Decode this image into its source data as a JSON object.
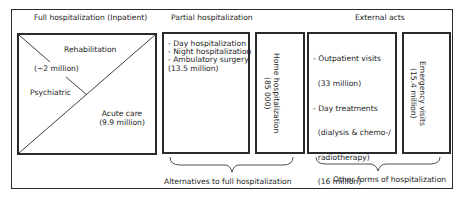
{
  "sections": {
    "full": {
      "title": "Full hospitalization (Inpatient)",
      "rehabilitation": "Rehabilitation",
      "rehab_count": "(~2 million)",
      "psychiatric": "Psychiatric",
      "acute_care": "Acute care",
      "acute_count": "(9.9 million)"
    },
    "partial": {
      "title": "Partial hospitalization",
      "items": [
        "- Day hospitalization",
        "- Night hospitalization",
        "- Ambulatory surgery",
        "(13.5 million)"
      ],
      "home": {
        "label": "Home hospitalization",
        "count": "(85 000)"
      }
    },
    "external": {
      "title": "External acts",
      "items": [
        "- Outpatient visits",
        "  (33 million)",
        "- Day treatments",
        "  (dialysis & chemo-/",
        "  radiotherapy)",
        "  (16 million)"
      ],
      "emergency": {
        "label": "Emergency visits",
        "count": "(15.4 million)"
      }
    }
  },
  "braces": {
    "alternatives": "Alternatives to full hospitalization",
    "other_forms": "Other forms of hospitalization"
  }
}
